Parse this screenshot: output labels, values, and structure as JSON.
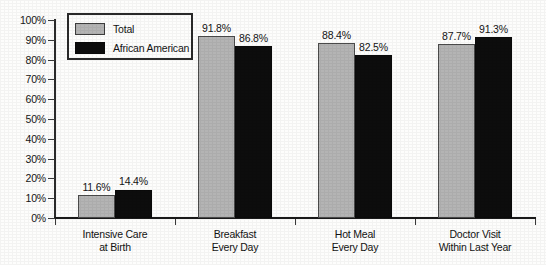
{
  "chart_data": {
    "type": "bar",
    "title": "",
    "subtitle": "",
    "xlabel": "",
    "ylabel": "",
    "ylim": [
      0,
      100
    ],
    "grid": false,
    "legend_position": "top-left",
    "y_ticks": [
      "0%",
      "10%",
      "20%",
      "30%",
      "40%",
      "50%",
      "60%",
      "70%",
      "80%",
      "90%",
      "100%"
    ],
    "y_tick_values": [
      0,
      10,
      20,
      30,
      40,
      50,
      60,
      70,
      80,
      90,
      100
    ],
    "categories": [
      "Intensive Care at Birth",
      "Breakfast Every Day",
      "Hot Meal Every Day",
      "Doctor Visit Within Last Year"
    ],
    "category_lines": [
      [
        "Intensive Care",
        "at Birth"
      ],
      [
        "Breakfast",
        "Every Day"
      ],
      [
        "Hot Meal",
        "Every Day"
      ],
      [
        "Doctor Visit",
        "Within Last Year"
      ]
    ],
    "series": [
      {
        "name": "Total",
        "color": "#b4b4b4",
        "values": [
          11.6,
          91.8,
          88.4,
          87.7
        ],
        "labels": [
          "11.6%",
          "91.8%",
          "88.4%",
          "87.7%"
        ]
      },
      {
        "name": "African American",
        "color": "#0d0d0d",
        "values": [
          14.4,
          86.8,
          82.5,
          91.3
        ],
        "labels": [
          "14.4%",
          "86.8%",
          "82.5%",
          "91.3%"
        ]
      }
    ]
  },
  "legend": {
    "items": [
      {
        "label": "Total",
        "swatch": "total"
      },
      {
        "label": "African American",
        "swatch": "aa"
      }
    ]
  },
  "colors": {
    "total_bar": "#b4b4b4",
    "african_american_bar": "#0d0d0d",
    "axis": "#1a1a1a",
    "text": "#131313",
    "background": "#fdfdfc"
  }
}
